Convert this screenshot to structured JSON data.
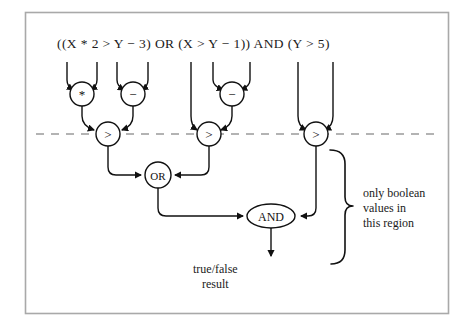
{
  "figure": {
    "background_color": "#ffffff",
    "frame_color": "#a9a9a9",
    "line_color": "#111111",
    "dashed_line_color": "#9a9a9a"
  },
  "expression": {
    "text": "((X * 2 > Y − 3) OR (X > Y − 1)) AND (Y > 5)"
  },
  "operands": [
    {
      "label": "X",
      "x": 67
    },
    {
      "label": "2",
      "x": 97
    },
    {
      "label": "Y",
      "x": 117
    },
    {
      "label": "3",
      "x": 148
    },
    {
      "label": "X",
      "x": 191
    },
    {
      "label": "Y",
      "x": 213
    },
    {
      "label": "1",
      "x": 250
    },
    {
      "label": "Y",
      "x": 298
    },
    {
      "label": "5",
      "x": 333
    }
  ],
  "nodes": [
    {
      "id": "mul",
      "label": "*",
      "shape": "circle",
      "cx": 82,
      "cy": 94,
      "r": 12
    },
    {
      "id": "sub1",
      "label": "−",
      "shape": "circle",
      "cx": 133,
      "cy": 94,
      "r": 12
    },
    {
      "id": "sub2",
      "label": "−",
      "shape": "circle",
      "cx": 232,
      "cy": 94,
      "r": 12
    },
    {
      "id": "gt1",
      "label": ">",
      "shape": "circle",
      "cx": 108,
      "cy": 134,
      "r": 12
    },
    {
      "id": "gt2",
      "label": ">",
      "shape": "circle",
      "cx": 209,
      "cy": 134,
      "r": 12
    },
    {
      "id": "gt3",
      "label": ">",
      "shape": "circle",
      "cx": 316,
      "cy": 134,
      "r": 12
    },
    {
      "id": "or",
      "label": "OR",
      "shape": "circle",
      "cx": 158,
      "cy": 175,
      "r": 13
    },
    {
      "id": "and",
      "label": "AND",
      "shape": "ellipse",
      "cx": 271,
      "cy": 216,
      "rx": 24,
      "ry": 12
    }
  ],
  "annotations": {
    "boolean_region": "only boolean\nvalues in\nthis region",
    "result": "true/false\nresult"
  },
  "boundary": {
    "dashed_y": 134,
    "dashed_x_start": 36,
    "dashed_x_end": 440
  }
}
